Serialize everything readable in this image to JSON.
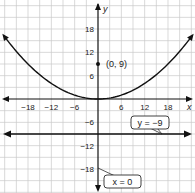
{
  "chart_data": {
    "type": "line",
    "title": "",
    "xlabel": "x",
    "ylabel": "y",
    "xlim": [
      -24,
      24
    ],
    "ylim": [
      -24,
      24
    ],
    "grid": true,
    "grid_step": 3,
    "x_ticks": [
      -18,
      -12,
      -6,
      6,
      12,
      18
    ],
    "y_ticks": [
      18,
      12,
      6,
      -6,
      -12,
      -18
    ],
    "x_tick_labels": [
      "−18",
      "−12",
      "−6",
      "6",
      "12",
      "18"
    ],
    "y_tick_labels": [
      "18",
      "12",
      "6",
      "−6",
      "−12",
      "−18"
    ],
    "series": [
      {
        "name": "parabola",
        "equation": "y = x^2 / 36",
        "x": [
          -24,
          -21,
          -18,
          -15,
          -12,
          -9,
          -6,
          -3,
          0,
          3,
          6,
          9,
          12,
          15,
          18,
          21,
          24
        ],
        "y": [
          16,
          12.25,
          9,
          6.25,
          4,
          2.25,
          1,
          0.25,
          0,
          0.25,
          1,
          2.25,
          4,
          6.25,
          9,
          12.25,
          16
        ]
      },
      {
        "name": "directrix",
        "equation": "y = -9",
        "x": [
          -24,
          24
        ],
        "y": [
          -9,
          -9
        ]
      }
    ],
    "points": [
      {
        "label": "(0, 9)",
        "x": 0,
        "y": 9
      }
    ],
    "annotations": [
      {
        "text": "y = −9",
        "target": "directrix"
      },
      {
        "text": "x = 0",
        "target": "axis of symmetry"
      }
    ]
  },
  "labels": {
    "x_axis": "x",
    "y_axis": "y",
    "focus_point": "(0, 9)",
    "directrix_callout": "y = −9",
    "axis_callout": "x = 0",
    "ticks_x": [
      "−18",
      "−12",
      "−6",
      "6",
      "12",
      "18"
    ],
    "ticks_y": [
      "18",
      "12",
      "6",
      "−6",
      "−12",
      "−18"
    ]
  }
}
